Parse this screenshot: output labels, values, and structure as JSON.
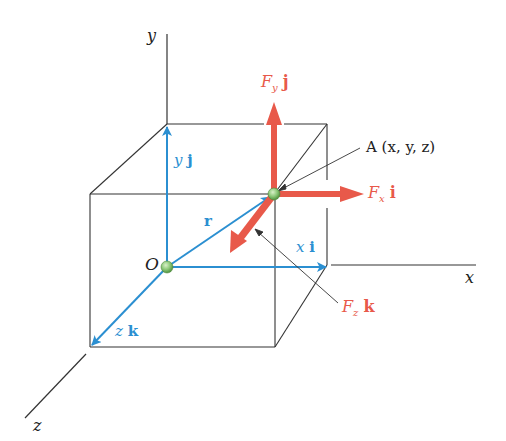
{
  "figure": {
    "type": "3D position vector and force components diagram",
    "axes": {
      "x": "x",
      "y": "y",
      "z": "z"
    },
    "origin_label": "O",
    "point_label": "A (x, y, z)",
    "position_vector": {
      "label": "r",
      "components": {
        "x": {
          "coef": "x",
          "unit": "i"
        },
        "y": {
          "coef": "y",
          "unit": "j"
        },
        "z": {
          "coef": "z",
          "unit": "k"
        }
      }
    },
    "force_components": {
      "x": {
        "F": "F",
        "sub": "x",
        "unit": "i"
      },
      "y": {
        "F": "F",
        "sub": "y",
        "unit": "j"
      },
      "z": {
        "F": "F",
        "sub": "z",
        "unit": "k"
      }
    },
    "colors": {
      "position_vectors": "#2b8fd1",
      "force_vectors": "#e8594a",
      "lines": "#333333",
      "points": "#7cc070"
    }
  }
}
